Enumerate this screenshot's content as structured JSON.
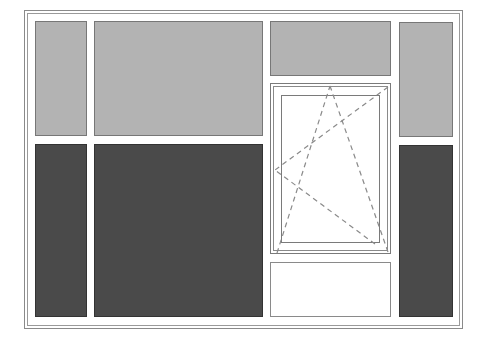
{
  "figure": {
    "title": "",
    "colors": {
      "background": "#ffffff",
      "frame_line": "#8a8a8a",
      "light_panel": "#b3b3b3",
      "dark_panel": "#4a4a4a",
      "opening_indicator": "#8a8a8a"
    },
    "panels": [
      {
        "id": "top-left-light",
        "type": "light"
      },
      {
        "id": "top-center-light",
        "type": "light"
      },
      {
        "id": "top-middle-light",
        "type": "light"
      },
      {
        "id": "top-right-light",
        "type": "light"
      },
      {
        "id": "bottom-left-dark",
        "type": "dark"
      },
      {
        "id": "bottom-center-dark",
        "type": "dark"
      },
      {
        "id": "window-sash",
        "type": "tilt-turn-window"
      },
      {
        "id": "bottom-middle-blank",
        "type": "blank"
      },
      {
        "id": "bottom-right-dark",
        "type": "dark"
      }
    ]
  }
}
